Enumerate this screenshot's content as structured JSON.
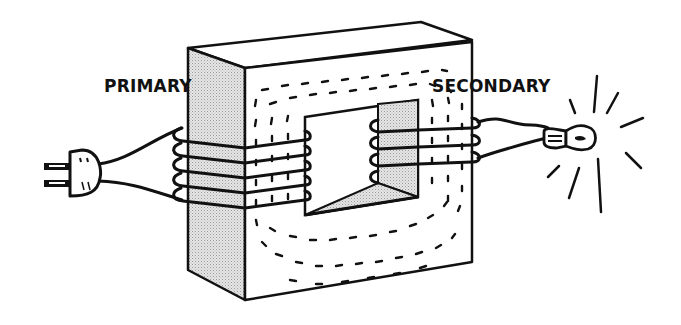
{
  "diagram": {
    "labels": {
      "primary": "PRIMARY",
      "secondary": "SECONDARY"
    },
    "components": [
      {
        "name": "power-plug",
        "side": "left",
        "connected_to": "primary-coil"
      },
      {
        "name": "primary-coil",
        "turns": 5,
        "on": "left-limb"
      },
      {
        "name": "iron-core",
        "shape": "rectangular ring",
        "shading": "dotted flux lines"
      },
      {
        "name": "secondary-coil",
        "turns": 3,
        "on": "right-limb"
      },
      {
        "name": "light-bulb",
        "side": "right",
        "state": "lit",
        "connected_to": "secondary-coil"
      }
    ],
    "colors": {
      "ink": "#111111",
      "background": "#ffffff",
      "shaded_face": "#d4d4d4"
    }
  }
}
